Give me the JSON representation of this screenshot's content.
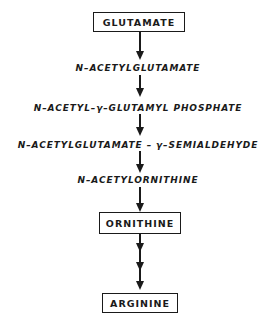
{
  "diagram": {
    "type": "biosynthetic-pathway",
    "boxed_nodes": {
      "start": "GLUTAMATE",
      "intermediate": "ORNITHINE",
      "end": "ARGININE"
    },
    "steps": [
      "GLUTAMATE",
      "N-ACETYLGLUTAMATE",
      "N-ACETYL-γ-GLUTAMYL PHOSPHATE",
      "N-ACETYLGLUTAMATE-γ-SEMIALDEHYDE",
      "N-ACETYLORNITHINE",
      "ORNITHINE",
      "ARGININE"
    ],
    "labels": {
      "n_acetylglutamate": "N–ACETYLGLUTAMATE",
      "n_acetyl_glutamyl_phosphate": "N–ACETYL–γ–GLUTAMYL  PHOSPHATE",
      "n_acetylglutamate_semialdehyde": "N–ACETYLGLUTAMATE – γ–SEMIALDEHYDE",
      "n_acetylornithine": "N–ACETYLORNITHINE"
    },
    "edges": [
      {
        "from": "GLUTAMATE",
        "to": "N-ACETYLGLUTAMATE",
        "arrowheads": 1
      },
      {
        "from": "N-ACETYLGLUTAMATE",
        "to": "N-ACETYL-γ-GLUTAMYL PHOSPHATE",
        "arrowheads": 1
      },
      {
        "from": "N-ACETYL-γ-GLUTAMYL PHOSPHATE",
        "to": "N-ACETYLGLUTAMATE-γ-SEMIALDEHYDE",
        "arrowheads": 1
      },
      {
        "from": "N-ACETYLGLUTAMATE-γ-SEMIALDEHYDE",
        "to": "N-ACETYLORNITHINE",
        "arrowheads": 1
      },
      {
        "from": "N-ACETYLORNITHINE",
        "to": "ORNITHINE",
        "arrowheads": 1
      },
      {
        "from": "ORNITHINE",
        "to": "ARGININE",
        "arrowheads": 3
      }
    ]
  }
}
